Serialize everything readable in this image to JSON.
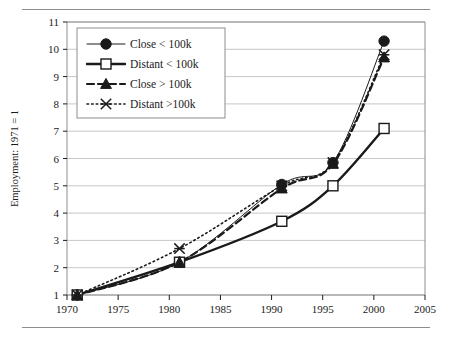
{
  "figure": {
    "top_rule": "",
    "bottom_rule": ""
  },
  "chart_data": {
    "type": "line",
    "title": "",
    "xlabel": "",
    "ylabel": "Employment: 1971 = 1",
    "xlim": [
      1970,
      2005
    ],
    "ylim": [
      1,
      11
    ],
    "xticks": [
      1970,
      1975,
      1980,
      1985,
      1990,
      1995,
      2000,
      2005
    ],
    "xtick_labels": [
      "1970",
      "1975",
      "1980",
      "1985",
      "1990",
      "1995",
      "2000",
      "2005"
    ],
    "yticks": [
      1,
      2,
      3,
      4,
      5,
      6,
      7,
      8,
      9,
      10,
      11
    ],
    "ytick_labels": [
      "1",
      "2",
      "3",
      "4",
      "5",
      "6",
      "7",
      "8",
      "9",
      "10",
      "11"
    ],
    "grid": "horizontal",
    "legend_position": "top-left",
    "x": [
      1971,
      1981,
      1991,
      1996,
      2001
    ],
    "series": [
      {
        "name": "Close < 100k",
        "marker": "filled-circle",
        "line_style": "solid-thin",
        "values": [
          1.0,
          2.2,
          5.05,
          5.85,
          10.3
        ]
      },
      {
        "name": "Distant < 100k",
        "marker": "open-square",
        "line_style": "solid-thick",
        "values": [
          1.0,
          2.2,
          3.7,
          5.0,
          7.1
        ]
      },
      {
        "name": "Close > 100k",
        "marker": "filled-triangle",
        "line_style": "dashed",
        "values": [
          1.0,
          2.2,
          4.9,
          5.8,
          9.7
        ]
      },
      {
        "name": "Distant >100k",
        "marker": "cross-x",
        "line_style": "dotted",
        "values": [
          1.0,
          2.7,
          5.0,
          5.85,
          9.8
        ]
      }
    ]
  },
  "colors": {
    "ink": "#1a1a1a",
    "grid": "#b9b9b9",
    "frame": "#8d8d8d",
    "rule": "#8d8d8d",
    "background": "#ffffff"
  }
}
